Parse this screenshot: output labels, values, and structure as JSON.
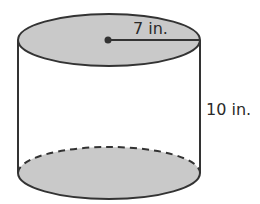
{
  "diagram": {
    "shape": "cylinder",
    "radius_label": "7 in.",
    "height_label": "10 in.",
    "colors": {
      "stroke": "#333333",
      "fill": "#c9c9c9",
      "background": "#ffffff"
    }
  }
}
